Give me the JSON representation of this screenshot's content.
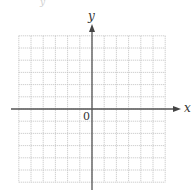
{
  "diagram": {
    "type": "coordinate-plane",
    "x_axis_label": "x",
    "y_axis_label": "y",
    "origin_label": "0",
    "grid": {
      "columns": 12,
      "rows": 12,
      "cells_left_of_y_axis": 6,
      "cells_right_of_y_axis": 6,
      "cells_above_x_axis": 6,
      "cells_below_x_axis": 6,
      "line_style": "dotted",
      "line_color": "#bdbdbd"
    },
    "axis_color": "#555555",
    "background": "#ffffff",
    "top_artifact_text": "y"
  }
}
